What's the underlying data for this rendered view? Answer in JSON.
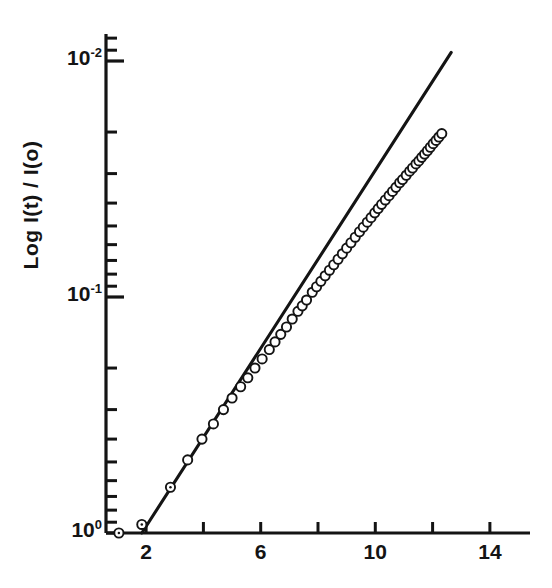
{
  "chart_data": {
    "type": "scatter",
    "title": "",
    "subtitle": "",
    "xlabel": "",
    "ylabel": "Log I(t) / I(o)",
    "ylabel_parts": {
      "prefix": "Log I(t) / I(o)"
    },
    "xlim": [
      0.6,
      15.4
    ],
    "ylim_log": [
      1.0,
      0.0062
    ],
    "y_scale": "log",
    "y_direction": "decreasing-upward",
    "grid": false,
    "legend": null,
    "marker_style": "open-circle",
    "marker_color": "#141414",
    "line_color": "#141414",
    "xticks_labeled": [
      {
        "value": 2,
        "label": "2"
      },
      {
        "value": 6,
        "label": "6"
      },
      {
        "value": 10,
        "label": "10"
      },
      {
        "value": 14,
        "label": "14"
      }
    ],
    "xticks_unlabeled": [
      4,
      8,
      12
    ],
    "yticks_major": [
      {
        "value": 1.0,
        "label": "10",
        "exp": "0"
      },
      {
        "value": 0.1,
        "label": "10",
        "exp": "-1"
      },
      {
        "value": 0.01,
        "label": "10",
        "exp": "-2"
      }
    ],
    "yticks_minor": [
      0.9,
      0.8,
      0.7,
      0.6,
      0.5,
      0.4,
      0.3,
      0.2,
      0.09,
      0.08,
      0.07,
      0.06,
      0.05,
      0.04,
      0.03,
      0.02,
      0.009,
      0.008,
      0.007
    ],
    "fit_line": {
      "x_start": 1.85,
      "x_end": 12.65,
      "y_start": 1.0,
      "y_end": 0.0092,
      "description": "straight line on semi-log axes (single-exponential decay)"
    },
    "x": [
      1.05,
      1.85,
      2.85,
      3.45,
      3.95,
      4.35,
      4.7,
      5.0,
      5.3,
      5.55,
      5.8,
      6.05,
      6.3,
      6.5,
      6.7,
      6.9,
      7.1,
      7.3,
      7.45,
      7.6,
      7.8,
      7.95,
      8.1,
      8.25,
      8.4,
      8.55,
      8.7,
      8.85,
      9.0,
      9.15,
      9.3,
      9.45,
      9.58,
      9.72,
      9.85,
      9.98,
      10.1,
      10.22,
      10.35,
      10.48,
      10.6,
      10.72,
      10.85,
      10.95,
      11.08,
      11.2,
      11.3,
      11.42,
      11.52,
      11.62,
      11.72,
      11.82,
      11.92,
      12.02,
      12.12,
      12.22,
      12.32
    ],
    "y": [
      1.0,
      0.92,
      0.64,
      0.49,
      0.4,
      0.345,
      0.3,
      0.268,
      0.24,
      0.22,
      0.2,
      0.183,
      0.167,
      0.155,
      0.144,
      0.134,
      0.124,
      0.115,
      0.109,
      0.103,
      0.0955,
      0.0905,
      0.0858,
      0.0813,
      0.077,
      0.073,
      0.0692,
      0.0656,
      0.0621,
      0.0589,
      0.0558,
      0.0529,
      0.0506,
      0.0482,
      0.0461,
      0.044,
      0.0422,
      0.0405,
      0.0388,
      0.0372,
      0.0357,
      0.0343,
      0.0328,
      0.0318,
      0.0305,
      0.0293,
      0.0284,
      0.0273,
      0.0265,
      0.0256,
      0.0248,
      0.024,
      0.0232,
      0.0224,
      0.0217,
      0.021,
      0.0203
    ]
  },
  "axes": {
    "x_axis_name": "x-axis",
    "y_axis_name": "y-axis"
  }
}
